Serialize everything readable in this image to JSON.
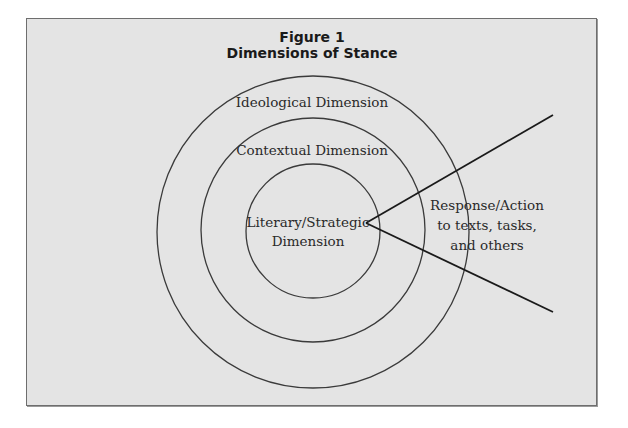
{
  "figure": {
    "number_label": "Figure 1",
    "title": "Dimensions of Stance"
  },
  "circles": [
    {
      "name": "outer",
      "label": "Ideological Dimension"
    },
    {
      "name": "middle",
      "label": "Contextual Dimension"
    },
    {
      "name": "inner",
      "label_line1": "Literary/Strategic",
      "label_line2": "Dimension"
    }
  ],
  "response": {
    "line1": "Response/Action",
    "line2": "to texts, tasks,",
    "line3": "and others"
  },
  "colors": {
    "background": "#e4e4e4",
    "stroke": "#3a3a3a",
    "text": "#2a2a2a"
  }
}
